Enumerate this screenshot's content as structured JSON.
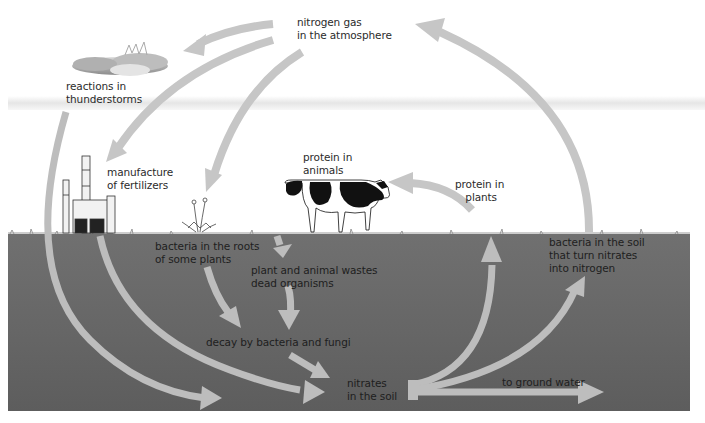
{
  "diagram": {
    "colors": {
      "sky": "#ffffff",
      "sky_band": "#ececec",
      "soil_top": "#6e6e6e",
      "soil_bottom": "#5f5f5f",
      "arrow_sky": "#c6c6c6",
      "arrow_soil": "#bdbdbd",
      "text": "#2b2b2b",
      "cow_black": "#111111"
    },
    "labels": {
      "atmosphere": "nitrogen gas\nin the atmosphere",
      "thunderstorms": "reactions in\nthunderstorms",
      "fertilizers": "manufacture\nof fertilizers",
      "protein_animals": "protein in\nanimals",
      "protein_plants": "protein in\nplants",
      "root_bacteria": "bacteria in the roots\nof some plants",
      "wastes": "plant and animal wastes\ndead organisms",
      "decay": "decay by bacteria and fungi",
      "nitrates": "nitrates\nin the soil",
      "ground_water": "to ground water",
      "denitrifying": "bacteria in the soil\nthat turn nitrates\ninto nitrogen"
    },
    "nodes": [
      {
        "id": "atmosphere",
        "name": "nitrogen gas in the atmosphere"
      },
      {
        "id": "thunderstorms",
        "name": "reactions in thunderstorms"
      },
      {
        "id": "fertilizers",
        "name": "manufacture of fertilizers"
      },
      {
        "id": "root_bacteria",
        "name": "bacteria in the roots of some plants"
      },
      {
        "id": "protein_animals",
        "name": "protein in animals"
      },
      {
        "id": "protein_plants",
        "name": "protein in plants"
      },
      {
        "id": "wastes",
        "name": "plant and animal wastes dead organisms"
      },
      {
        "id": "decay",
        "name": "decay by bacteria and fungi"
      },
      {
        "id": "nitrates",
        "name": "nitrates in the soil"
      },
      {
        "id": "ground_water",
        "name": "to ground water"
      },
      {
        "id": "denitrifying",
        "name": "bacteria in the soil that turn nitrates into nitrogen"
      }
    ],
    "edges": [
      {
        "from": "atmosphere",
        "to": "thunderstorms"
      },
      {
        "from": "atmosphere",
        "to": "fertilizers"
      },
      {
        "from": "atmosphere",
        "to": "root_bacteria"
      },
      {
        "from": "thunderstorms",
        "to": "nitrates"
      },
      {
        "from": "fertilizers",
        "to": "nitrates"
      },
      {
        "from": "root_bacteria",
        "to": "decay"
      },
      {
        "from": "protein_animals",
        "to": "wastes"
      },
      {
        "from": "wastes",
        "to": "decay"
      },
      {
        "from": "decay",
        "to": "nitrates"
      },
      {
        "from": "nitrates",
        "to": "protein_plants"
      },
      {
        "from": "protein_plants",
        "to": "protein_animals"
      },
      {
        "from": "nitrates",
        "to": "denitrifying"
      },
      {
        "from": "nitrates",
        "to": "ground_water"
      },
      {
        "from": "denitrifying",
        "to": "atmosphere"
      }
    ]
  }
}
